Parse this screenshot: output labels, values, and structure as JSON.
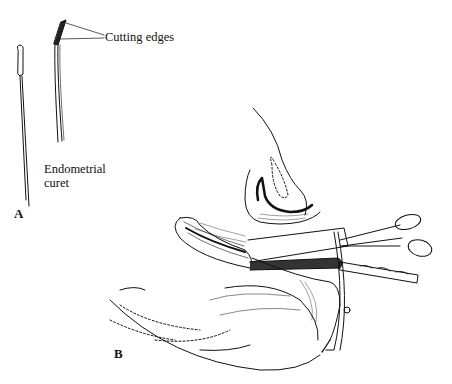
{
  "figure": {
    "panels": [
      {
        "id": "A",
        "label": "A"
      },
      {
        "id": "B",
        "label": "B"
      }
    ],
    "annotations": {
      "cutting_edges": "Cutting edges",
      "curet_line1": "Endometrial",
      "curet_line2": "curet"
    },
    "colors": {
      "ink": "#111111",
      "background": "#ffffff"
    }
  }
}
